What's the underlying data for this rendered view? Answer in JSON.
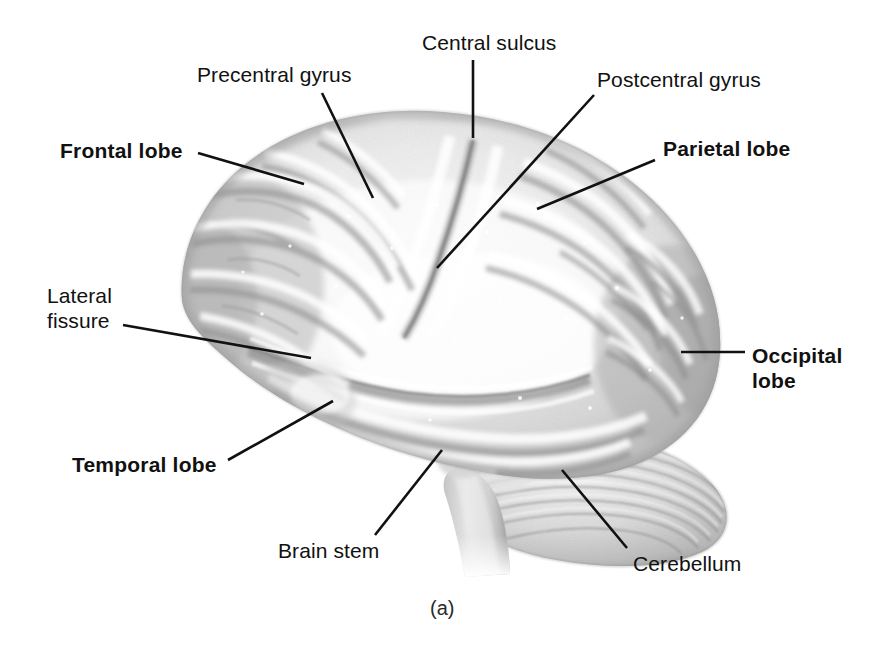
{
  "figure": {
    "caption": "(a)",
    "background_color": "#ffffff",
    "line_color": "#111111",
    "text_color": "#111111"
  },
  "labels": [
    {
      "key": "precentral_gyrus",
      "text": "Precentral gyrus",
      "bold": false,
      "x": 197,
      "y": 62,
      "leader": {
        "x1": 322,
        "y1": 93,
        "x2": 373,
        "y2": 198
      }
    },
    {
      "key": "central_sulcus",
      "text": "Central sulcus",
      "bold": false,
      "x": 422,
      "y": 30,
      "leader": {
        "x1": 473,
        "y1": 60,
        "x2": 473,
        "y2": 138
      }
    },
    {
      "key": "postcentral_gyrus",
      "text": "Postcentral gyrus",
      "bold": false,
      "x": 597,
      "y": 67,
      "leader": {
        "x1": 594,
        "y1": 95,
        "x2": 437,
        "y2": 268
      }
    },
    {
      "key": "frontal_lobe",
      "text": "Frontal lobe",
      "bold": true,
      "x": 60,
      "y": 138,
      "leader": {
        "x1": 198,
        "y1": 153,
        "x2": 304,
        "y2": 184
      }
    },
    {
      "key": "parietal_lobe",
      "text": "Parietal lobe",
      "bold": true,
      "x": 663,
      "y": 136,
      "leader": {
        "x1": 655,
        "y1": 160,
        "x2": 537,
        "y2": 209
      }
    },
    {
      "key": "lateral_fissure",
      "text": "Lateral\nfissure",
      "bold": false,
      "x": 47,
      "y": 283,
      "leader": {
        "x1": 123,
        "y1": 325,
        "x2": 311,
        "y2": 358
      }
    },
    {
      "key": "occipital_lobe",
      "text": "Occipital\nlobe",
      "bold": true,
      "x": 752,
      "y": 343,
      "leader": {
        "x1": 745,
        "y1": 352,
        "x2": 681,
        "y2": 352
      }
    },
    {
      "key": "temporal_lobe",
      "text": "Temporal lobe",
      "bold": true,
      "x": 72,
      "y": 452,
      "leader": {
        "x1": 228,
        "y1": 460,
        "x2": 333,
        "y2": 401
      }
    },
    {
      "key": "brain_stem",
      "text": "Brain stem",
      "bold": false,
      "x": 278,
      "y": 538,
      "leader": {
        "x1": 375,
        "y1": 535,
        "x2": 442,
        "y2": 450
      }
    },
    {
      "key": "cerebellum",
      "text": "Cerebellum",
      "bold": false,
      "x": 633,
      "y": 551,
      "leader": {
        "x1": 627,
        "y1": 548,
        "x2": 562,
        "y2": 470
      }
    }
  ],
  "anatomy": {
    "parts": [
      {
        "key": "cerebrum",
        "name": "Cerebrum"
      },
      {
        "key": "cerebellum",
        "name": "Cerebellum"
      },
      {
        "key": "brainstem",
        "name": "Brain stem"
      }
    ]
  }
}
